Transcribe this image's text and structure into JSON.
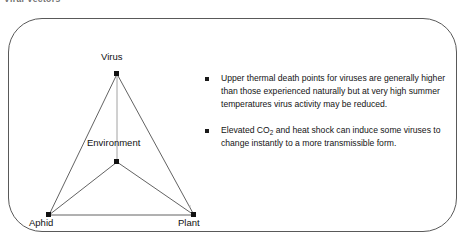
{
  "header": {
    "title": "Viral Vectors"
  },
  "diagram": {
    "name": "virus-aphid-plant-environment-triangle",
    "nodes": [
      {
        "id": "virus",
        "label": "Virus",
        "x": 94,
        "y": 29
      },
      {
        "id": "environment",
        "label": "Environment",
        "x": 94,
        "y": 117
      },
      {
        "id": "aphid",
        "label": "Aphid",
        "x": 26,
        "y": 170
      },
      {
        "id": "plant",
        "label": "Plant",
        "x": 171,
        "y": 170
      }
    ],
    "edges": [
      {
        "from": "virus",
        "to": "aphid"
      },
      {
        "from": "virus",
        "to": "plant"
      },
      {
        "from": "aphid",
        "to": "plant"
      },
      {
        "from": "virus",
        "to": "environment"
      },
      {
        "from": "environment",
        "to": "aphid"
      },
      {
        "from": "environment",
        "to": "plant"
      }
    ],
    "line_color": "#3a3a3a",
    "node_color": "#111111"
  },
  "bullets": [
    {
      "pre": "Upper thermal death points for viruses are generally higher than those experienced naturally but at very high summer temperatures virus activity may be reduced.",
      "sub": "",
      "post": ""
    },
    {
      "pre": "Elevated CO",
      "sub": "2",
      "post": " and heat shock can induce some viruses to change instantly to a more transmissible form."
    }
  ],
  "frame": {
    "border_color": "#595959",
    "background": "#ffffff"
  }
}
